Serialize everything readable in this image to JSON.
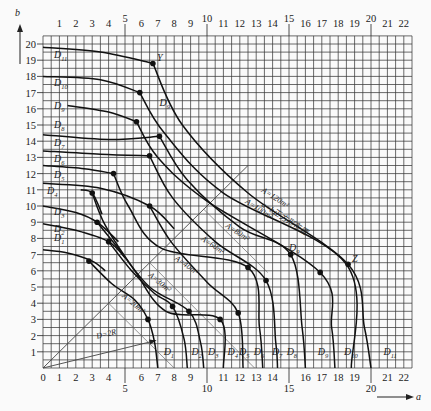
{
  "chart_data": {
    "type": "line",
    "title": "",
    "xlabel": "a",
    "ylabel": "b",
    "xlim": [
      0,
      22.5
    ],
    "ylim": [
      0,
      20.5
    ],
    "grid": true,
    "grid_step": 0.5,
    "x_ticks_top": [
      "1",
      "2",
      "3",
      "4",
      "5",
      "6",
      "7",
      "8",
      "9",
      "10",
      "11",
      "12",
      "13",
      "14",
      "15",
      "16",
      "17",
      "18",
      "19",
      "20",
      "21",
      "22"
    ],
    "x_ticks_bottom": [
      "0",
      "1",
      "2",
      "3",
      "4",
      "5",
      "6",
      "7",
      "8",
      "9",
      "10",
      "11",
      "12",
      "13",
      "14",
      "15",
      "16",
      "17",
      "18",
      "19",
      "20",
      "21",
      "22"
    ],
    "y_ticks": [
      "1",
      "2",
      "3",
      "4",
      "5",
      "6",
      "7",
      "8",
      "9",
      "10",
      "11",
      "12",
      "13",
      "14",
      "15",
      "16",
      "17",
      "18",
      "19",
      "20"
    ],
    "diameter_curves": [
      {
        "name": "D1",
        "label": "D",
        "sub": "1",
        "b_intercept": 7.3,
        "a_intercept": 7.0,
        "knee": [
          6.4,
          3.0
        ]
      },
      {
        "name": "D2",
        "label": "D",
        "sub": "2",
        "b_intercept": 8.9,
        "a_intercept": 8.8,
        "knee": [
          7.9,
          3.8
        ]
      },
      {
        "name": "D3",
        "label": "D",
        "sub": "3",
        "b_intercept": 10.0,
        "a_intercept": 9.8,
        "knee": [
          8.9,
          3.5
        ]
      },
      {
        "name": "D4",
        "label": "D",
        "sub": "4",
        "b_intercept": 10.9,
        "a_intercept": 11.0,
        "knee": [
          10.8,
          3.0
        ]
      },
      {
        "name": "D5",
        "label": "D",
        "sub": "5",
        "b_intercept": 11.4,
        "a_intercept": 12.2,
        "knee": [
          11.9,
          3.4
        ]
      },
      {
        "name": "D6",
        "label": "D",
        "sub": "6",
        "b_intercept": 12.5,
        "a_intercept": 13.4,
        "knee": [
          12.5,
          6.2
        ]
      },
      {
        "name": "D7",
        "label": "D",
        "sub": "7",
        "b_intercept": 13.4,
        "a_intercept": 14.3,
        "knee": [
          13.6,
          5.4
        ]
      },
      {
        "name": "D8",
        "label": "D",
        "sub": "8",
        "b_intercept": 14.4,
        "a_intercept": 16.0,
        "knee": [
          15.1,
          7.0
        ]
      },
      {
        "name": "D9",
        "label": "D",
        "sub": "9",
        "b_intercept": 16.2,
        "a_intercept": 17.8,
        "knee": [
          16.9,
          5.9
        ]
      },
      {
        "name": "D10",
        "label": "D",
        "sub": "10",
        "b_intercept": 18.0,
        "a_intercept": 18.8,
        "knee": [
          18.5,
          6.4
        ]
      },
      {
        "name": "D11",
        "label": "D",
        "sub": "11",
        "b_intercept": 19.8,
        "a_intercept": 20.0,
        "knee": [
          6.7,
          18.8
        ]
      }
    ],
    "area_curves": [
      {
        "label": "A=20m²",
        "value": 20
      },
      {
        "label": "A=30m²",
        "value": 30
      },
      {
        "label": "A=40m²",
        "value": 40
      },
      {
        "label": "A=60m²",
        "value": 60
      },
      {
        "label": "A=80m²",
        "value": 80
      },
      {
        "label": "A=100m²",
        "value": 100
      },
      {
        "label": "A=120m²",
        "value": 120
      }
    ],
    "annotations": [
      {
        "text": "Y",
        "at": [
          6.7,
          18.8
        ]
      },
      {
        "text": "Z",
        "at": [
          18.6,
          6.4
        ]
      },
      {
        "text": "D9",
        "at": [
          7.1,
          16.2
        ]
      },
      {
        "text": "D9",
        "at": [
          15.0,
          7.2
        ]
      },
      {
        "text": "D=2R",
        "at": [
          4.0,
          2.0
        ]
      },
      {
        "text": "a=b正方形布置",
        "at": [
          13.3,
          10.0
        ]
      }
    ],
    "square_layout_line": {
      "label": "a=b正方形布置",
      "from": [
        0,
        0
      ],
      "to": [
        12.5,
        12.5
      ]
    },
    "radius_line": {
      "label": "D=2R",
      "from": [
        0,
        0
      ],
      "to": [
        6.9,
        1.7
      ]
    }
  },
  "axes": {
    "x_arrow_label": "a",
    "y_arrow_label": "b"
  }
}
